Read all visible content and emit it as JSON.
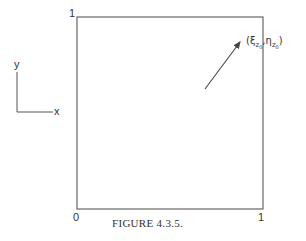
{
  "figure": {
    "caption": "FIGURE 4.3.5.",
    "box": {
      "corner_labels": {
        "top_left": "1",
        "bottom_left": "0",
        "bottom_right": "1"
      }
    },
    "axes_indicator": {
      "x_label": "x",
      "y_label": "y"
    },
    "point_label": {
      "open": "(",
      "xi": "ξ",
      "z": "z",
      "sub0": "0",
      "comma": ",",
      "eta": "η",
      "close": ")"
    },
    "arrow": {
      "from": [
        205,
        89
      ],
      "to": [
        241,
        40
      ]
    },
    "colors": {
      "line": "#555555",
      "text": "#333333"
    }
  }
}
